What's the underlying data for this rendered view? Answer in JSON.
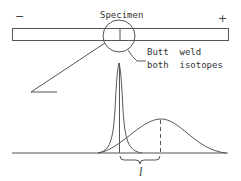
{
  "diagram": {
    "specimen_label": "Specimen",
    "minus_label": "−",
    "plus_label": "+",
    "weld_label_line1": "Butt  weld",
    "weld_label_line2": "both  isotopes",
    "distance_label": "l",
    "stroke_color": "#555555"
  }
}
